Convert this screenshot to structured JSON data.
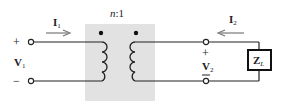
{
  "diagram": {
    "type": "ideal transformer circuit",
    "turns_ratio": {
      "n": "n",
      "sep": ":",
      "m": "1"
    },
    "primary": {
      "current": {
        "base": "I",
        "sub": "1",
        "direction": "right"
      },
      "voltage": {
        "base": "V",
        "sub": "1"
      },
      "plus": "+",
      "minus": "−"
    },
    "secondary": {
      "current": {
        "base": "I",
        "sub": "2",
        "direction": "left"
      },
      "voltage": {
        "base": "V",
        "sub": "2"
      },
      "plus": "+",
      "minus": "−"
    },
    "load": {
      "base": "Z",
      "sub": "L"
    },
    "colors": {
      "core_fill": "#e2e2e2",
      "wire": "#222222",
      "arrow": "#777777"
    }
  }
}
